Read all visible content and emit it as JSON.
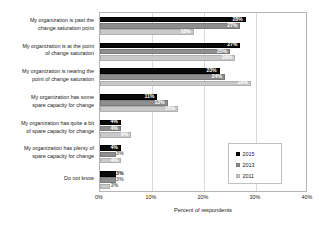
{
  "chart_data": {
    "type": "bar",
    "orientation": "horizontal",
    "title": "",
    "xlabel": "Percent of respondents",
    "ylabel": "",
    "xlim": [
      0,
      40
    ],
    "xticks": [
      "0%",
      "10%",
      "20%",
      "30%",
      "40%"
    ],
    "xtick_values": [
      0,
      10,
      20,
      30,
      40
    ],
    "grid": true,
    "legend_position": "middle-right",
    "categories": [
      "My organization is past the\nchange saturation point",
      "My organization is at the point\nof change saturation",
      "My organization is nearing the\npoint of change saturation",
      "My organization has some\nspare capacity for change",
      "My organization has quite a bit\nof spare capacity for change",
      "My organization has plenty of\nspare capacity for change",
      "Do not know"
    ],
    "series": [
      {
        "name": "2015",
        "color": "#0a0a0a",
        "values": [
          28,
          27,
          23,
          11,
          4,
          4,
          3
        ],
        "labels": [
          "28%",
          "27%",
          "23%",
          "11%",
          "4%",
          "4%",
          "3%"
        ]
      },
      {
        "name": "2013",
        "color": "#8e8e8e",
        "values": [
          27,
          25,
          24,
          13,
          4,
          3,
          3
        ],
        "labels": [
          "27%",
          "25%",
          "24%",
          "13%",
          "4%",
          "3%",
          "3%"
        ]
      },
      {
        "name": "2011",
        "color": "#c9c9c9",
        "values": [
          18,
          26,
          29,
          15,
          6,
          4,
          2
        ],
        "labels": [
          "18%",
          "26%",
          "29%",
          "15%",
          "6%",
          "4%",
          "2%"
        ]
      }
    ]
  },
  "legend": {
    "items": [
      {
        "label": "2015",
        "swatch": "s2015"
      },
      {
        "label": "2013",
        "swatch": "s2013"
      },
      {
        "label": "2011",
        "swatch": "s2011"
      }
    ]
  }
}
